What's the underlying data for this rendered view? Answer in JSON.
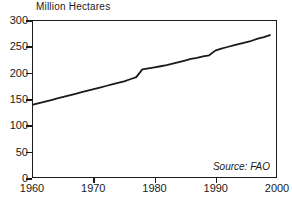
{
  "chart_data": {
    "type": "line",
    "title": "Million Hectares",
    "xlabel": "",
    "ylabel": "Million Hectares",
    "xlim": [
      1960,
      2000
    ],
    "ylim": [
      0,
      300
    ],
    "grid": false,
    "legend": null,
    "annotations": [
      {
        "text": "Source: FAO",
        "position": "bottom-right",
        "style": "italic"
      }
    ],
    "xticks": [
      1960,
      1970,
      1980,
      1990,
      2000
    ],
    "xtick_labels": [
      "1960",
      "1970",
      "1980",
      "1990",
      "2000"
    ],
    "yticks": [
      0,
      50,
      100,
      150,
      200,
      250,
      300
    ],
    "ytick_labels": [
      "0",
      "50",
      "100",
      "150",
      "200",
      "250",
      "300"
    ],
    "series": [
      {
        "name": "Irrigated Area",
        "color": "#1a1a1a",
        "x": [
          1960,
          1961,
          1962,
          1963,
          1964,
          1965,
          1966,
          1967,
          1968,
          1969,
          1970,
          1971,
          1972,
          1973,
          1974,
          1975,
          1976,
          1977,
          1978,
          1979,
          1980,
          1981,
          1982,
          1983,
          1984,
          1985,
          1986,
          1987,
          1988,
          1989,
          1990,
          1991,
          1992,
          1993,
          1994,
          1995,
          1996,
          1997,
          1998,
          1999
        ],
        "values": [
          139,
          142,
          145,
          148,
          151,
          154,
          157,
          160,
          163,
          166,
          169,
          172,
          175,
          178,
          181,
          184,
          188,
          192,
          207,
          209,
          211,
          213,
          215,
          218,
          221,
          224,
          227,
          229,
          232,
          234,
          243,
          247,
          250,
          253,
          256,
          259,
          262,
          266,
          269,
          273
        ]
      }
    ]
  },
  "figure": {
    "background_color": "#ffffff",
    "axis_color": "#1a1a1a",
    "line_color": "#1a1a1a"
  }
}
